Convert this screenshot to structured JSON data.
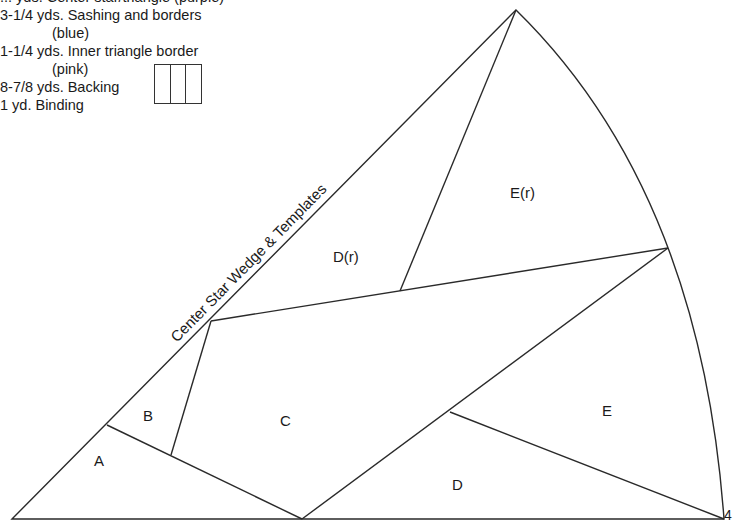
{
  "materials": {
    "lines": [
      {
        "text": "... yds. Center star/triangle (purple)",
        "indent": false
      },
      {
        "text": "3-1/4 yds. Sashing and borders",
        "indent": false
      },
      {
        "text": "(blue)",
        "indent": true
      },
      {
        "text": "1-1/4 yds. Inner triangle border",
        "indent": false
      },
      {
        "text": "(pink)",
        "indent": true
      },
      {
        "text": "8-7/8 yds. Backing",
        "indent": false
      },
      {
        "text": "1 yd. Binding",
        "indent": false
      }
    ],
    "backing_panels": 3
  },
  "diagram": {
    "title": "Center Star Wedge & Templates",
    "pieces": [
      "A",
      "B",
      "C",
      "D",
      "E",
      "D(r)",
      "E(r)"
    ],
    "corner_mark": "4"
  }
}
